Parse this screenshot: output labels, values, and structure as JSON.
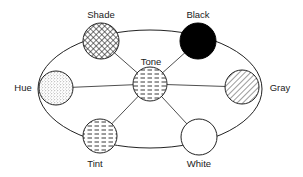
{
  "diagram": {
    "type": "color-relationship-wheel",
    "center_node": "Tone",
    "nodes": [
      {
        "id": "shade",
        "label": "Shade",
        "fill": "crosshatch",
        "cx": 101,
        "cy": 41,
        "r": 18
      },
      {
        "id": "black",
        "label": "Black",
        "fill": "solid-black",
        "cx": 198,
        "cy": 41,
        "r": 18
      },
      {
        "id": "hue",
        "label": "Hue",
        "fill": "stipple",
        "cx": 56,
        "cy": 88,
        "r": 17
      },
      {
        "id": "tone",
        "label": "Tone",
        "fill": "dashed-horizontal",
        "cx": 150,
        "cy": 84,
        "r": 17
      },
      {
        "id": "gray",
        "label": "Gray",
        "fill": "diagonal-hatch",
        "cx": 242,
        "cy": 87,
        "r": 17
      },
      {
        "id": "tint",
        "label": "Tint",
        "fill": "dashed-horizontal",
        "cx": 100,
        "cy": 136,
        "r": 17
      },
      {
        "id": "white",
        "label": "White",
        "fill": "white",
        "cx": 199,
        "cy": 137,
        "r": 18
      }
    ],
    "edges": [
      [
        "tone",
        "shade"
      ],
      [
        "tone",
        "black"
      ],
      [
        "tone",
        "hue"
      ],
      [
        "tone",
        "gray"
      ],
      [
        "tone",
        "tint"
      ],
      [
        "tone",
        "white"
      ]
    ],
    "labels": {
      "shade": "Shade",
      "black": "Black",
      "hue": "Hue",
      "tone": "Tone",
      "gray": "Gray",
      "tint": "Tint",
      "white": "White"
    },
    "colors": {
      "stroke": "#222222",
      "black_fill": "#000000",
      "white_fill": "#ffffff"
    }
  }
}
